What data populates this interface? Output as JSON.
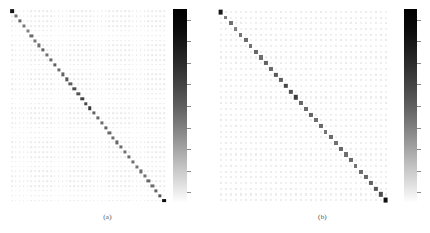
{
  "figure": {
    "title": "",
    "panels": [
      {
        "id": "a",
        "caption": "(a)",
        "caption_x": 110,
        "caption_y": 213,
        "matrix": {
          "left": 10,
          "top": 9,
          "width": 156,
          "height": 194,
          "rows": 40,
          "cols": 40,
          "background": "#ffffff",
          "dot_color": "#d8d8d8",
          "diag_color": "#4d4d4d"
        },
        "colorbar": {
          "left": 173,
          "top": 9,
          "width": 14,
          "height": 194,
          "vmin_color": "#ffffff",
          "vmax_color": "#000000",
          "orientation": "vertical",
          "ticks": 9
        }
      },
      {
        "id": "b",
        "caption": "(b)",
        "caption_x": 100,
        "caption_y": 213,
        "matrix": {
          "left": 3,
          "top": 9,
          "width": 170,
          "height": 194,
          "rows": 34,
          "cols": 34,
          "background": "#ffffff",
          "dot_color": "#dcdcdc",
          "diag_color": "#555555"
        },
        "colorbar": {
          "left": 189,
          "top": 9,
          "width": 13,
          "height": 194,
          "vmin_color": "#ffffff",
          "vmax_color": "#000000",
          "orientation": "vertical",
          "ticks": 9
        }
      }
    ]
  },
  "chart_data": {
    "type": "heatmap",
    "title": "",
    "xlabel": "",
    "ylabel": "",
    "grid": true,
    "legend": "colorbar-right",
    "colormap": "grayscale-reversed",
    "panels": [
      {
        "label": "(a)",
        "rows": 40,
        "cols": 40,
        "description": "Diagonally dominant matrix: strong dark values along the main diagonal, near-zero faint values elsewhere.",
        "vmin": 0.0,
        "vmax": 1.0,
        "diagonal_values": [
          0.92,
          0.55,
          0.6,
          0.52,
          0.5,
          0.58,
          0.54,
          0.57,
          0.62,
          0.56,
          0.59,
          0.63,
          0.58,
          0.61,
          0.66,
          0.64,
          0.7,
          0.68,
          0.74,
          0.72,
          0.78,
          0.62,
          0.6,
          0.58,
          0.61,
          0.59,
          0.57,
          0.6,
          0.58,
          0.56,
          0.59,
          0.57,
          0.55,
          0.58,
          0.56,
          0.6,
          0.58,
          0.62,
          0.66,
          0.95
        ],
        "offdiagonal_typical": 0.06
      },
      {
        "label": "(b)",
        "rows": 34,
        "cols": 34,
        "description": "Diagonally dominant matrix with slightly coarser grid; dark main diagonal with faint background lattice.",
        "vmin": 0.0,
        "vmax": 1.0,
        "diagonal_values": [
          0.9,
          0.52,
          0.56,
          0.5,
          0.54,
          0.58,
          0.55,
          0.6,
          0.57,
          0.62,
          0.59,
          0.65,
          0.63,
          0.72,
          0.68,
          0.76,
          0.6,
          0.58,
          0.61,
          0.57,
          0.59,
          0.55,
          0.58,
          0.56,
          0.6,
          0.57,
          0.59,
          0.55,
          0.58,
          0.6,
          0.62,
          0.66,
          0.7,
          0.94
        ],
        "offdiagonal_typical": 0.05
      }
    ]
  }
}
